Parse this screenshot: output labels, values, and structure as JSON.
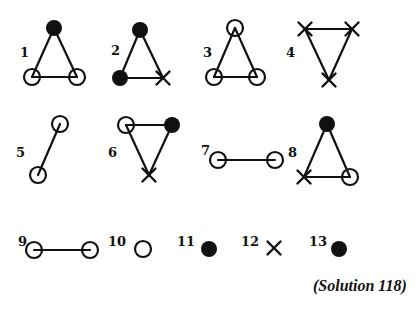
{
  "colors": {
    "ink": "#111111",
    "background": "#ffffff"
  },
  "caption": "(Solution 118)",
  "node_types": {
    "open": "open-circle",
    "filled": "filled-circle",
    "cross": "cross-mark"
  },
  "figures": [
    {
      "id": 1,
      "label": "1",
      "label_pos": [
        20,
        57
      ],
      "nodes": [
        {
          "type": "filled",
          "x": 54,
          "y": 28
        },
        {
          "type": "open",
          "x": 32,
          "y": 77
        },
        {
          "type": "open",
          "x": 77,
          "y": 77
        }
      ],
      "edges": [
        [
          0,
          1
        ],
        [
          0,
          2
        ],
        [
          1,
          2
        ]
      ]
    },
    {
      "id": 2,
      "label": "2",
      "label_pos": [
        111,
        55
      ],
      "nodes": [
        {
          "type": "filled",
          "x": 140,
          "y": 30
        },
        {
          "type": "filled",
          "x": 120,
          "y": 78
        },
        {
          "type": "cross",
          "x": 163,
          "y": 78
        }
      ],
      "edges": [
        [
          0,
          1
        ],
        [
          0,
          2
        ],
        [
          1,
          2
        ]
      ]
    },
    {
      "id": 3,
      "label": "3",
      "label_pos": [
        203,
        57
      ],
      "nodes": [
        {
          "type": "open",
          "x": 235,
          "y": 28
        },
        {
          "type": "open",
          "x": 214,
          "y": 77
        },
        {
          "type": "open",
          "x": 257,
          "y": 77
        }
      ],
      "edges": [
        [
          0,
          1
        ],
        [
          0,
          2
        ],
        [
          1,
          2
        ]
      ]
    },
    {
      "id": 4,
      "label": "4",
      "label_pos": [
        286,
        57
      ],
      "nodes": [
        {
          "type": "cross",
          "x": 305,
          "y": 29
        },
        {
          "type": "cross",
          "x": 352,
          "y": 29
        },
        {
          "type": "cross",
          "x": 329,
          "y": 80
        }
      ],
      "edges": [
        [
          0,
          1
        ],
        [
          0,
          2
        ],
        [
          1,
          2
        ]
      ]
    },
    {
      "id": 5,
      "label": "5",
      "label_pos": [
        16,
        157
      ],
      "nodes": [
        {
          "type": "open",
          "x": 60,
          "y": 124
        },
        {
          "type": "open",
          "x": 38,
          "y": 175
        }
      ],
      "edges": [
        [
          0,
          1
        ]
      ]
    },
    {
      "id": 6,
      "label": "6",
      "label_pos": [
        108,
        157
      ],
      "nodes": [
        {
          "type": "open",
          "x": 126,
          "y": 125
        },
        {
          "type": "filled",
          "x": 172,
          "y": 125
        },
        {
          "type": "cross",
          "x": 149,
          "y": 175
        }
      ],
      "edges": [
        [
          0,
          1
        ],
        [
          0,
          2
        ],
        [
          1,
          2
        ]
      ]
    },
    {
      "id": 7,
      "label": "7",
      "label_pos": [
        201,
        155
      ],
      "nodes": [
        {
          "type": "open",
          "x": 218,
          "y": 160
        },
        {
          "type": "open",
          "x": 275,
          "y": 160
        }
      ],
      "edges": [
        [
          0,
          1
        ]
      ]
    },
    {
      "id": 8,
      "label": "8",
      "label_pos": [
        288,
        157
      ],
      "nodes": [
        {
          "type": "filled",
          "x": 327,
          "y": 124
        },
        {
          "type": "cross",
          "x": 304,
          "y": 177
        },
        {
          "type": "open",
          "x": 350,
          "y": 177
        }
      ],
      "edges": [
        [
          0,
          1
        ],
        [
          0,
          2
        ],
        [
          1,
          2
        ]
      ]
    },
    {
      "id": 9,
      "label": "9",
      "label_pos": [
        18,
        246
      ],
      "nodes": [
        {
          "type": "open",
          "x": 34,
          "y": 250
        },
        {
          "type": "open",
          "x": 90,
          "y": 250
        }
      ],
      "edges": [
        [
          0,
          1
        ]
      ]
    },
    {
      "id": 10,
      "label": "10",
      "label_pos": [
        108,
        246
      ],
      "nodes": [
        {
          "type": "open",
          "x": 143,
          "y": 249
        }
      ],
      "edges": []
    },
    {
      "id": 11,
      "label": "11",
      "label_pos": [
        177,
        246
      ],
      "nodes": [
        {
          "type": "filled",
          "x": 209,
          "y": 249
        }
      ],
      "edges": []
    },
    {
      "id": 12,
      "label": "12",
      "label_pos": [
        241,
        246
      ],
      "nodes": [
        {
          "type": "cross",
          "x": 274,
          "y": 248
        }
      ],
      "edges": []
    },
    {
      "id": 13,
      "label": "13",
      "label_pos": [
        309,
        246
      ],
      "nodes": [
        {
          "type": "filled",
          "x": 339,
          "y": 249
        }
      ],
      "edges": []
    }
  ]
}
